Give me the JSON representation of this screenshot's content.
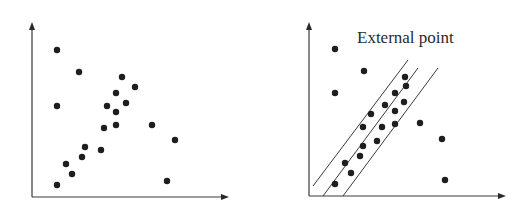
{
  "chart_data": [
    {
      "type": "scatter",
      "title": "",
      "xlabel": "",
      "ylabel": "",
      "grid": false,
      "legend": null,
      "axes": {
        "origin": [
          32,
          197
        ],
        "y_top": 22,
        "x_right": 229
      },
      "points": [
        [
          57,
          50
        ],
        [
          79,
          72
        ],
        [
          57,
          106
        ],
        [
          122,
          77
        ],
        [
          135,
          87
        ],
        [
          116,
          93
        ],
        [
          126,
          103
        ],
        [
          107,
          106
        ],
        [
          116,
          112
        ],
        [
          116,
          125
        ],
        [
          104,
          128
        ],
        [
          152,
          125
        ],
        [
          175,
          140
        ],
        [
          85,
          147
        ],
        [
          101,
          150
        ],
        [
          82,
          157
        ],
        [
          66,
          164
        ],
        [
          72,
          174
        ],
        [
          57,
          185
        ],
        [
          167,
          181
        ]
      ],
      "lines": [],
      "annotations": []
    },
    {
      "type": "scatter",
      "title": "",
      "xlabel": "",
      "ylabel": "",
      "grid": false,
      "legend": null,
      "axes": {
        "origin": [
          309,
          196
        ],
        "y_top": 22,
        "x_right": 506
      },
      "points": [
        [
          335,
          49
        ],
        [
          364,
          71
        ],
        [
          335,
          93
        ],
        [
          405,
          77
        ],
        [
          406,
          86
        ],
        [
          395,
          93
        ],
        [
          404,
          102
        ],
        [
          385,
          105
        ],
        [
          395,
          111
        ],
        [
          371,
          114
        ],
        [
          395,
          124
        ],
        [
          363,
          127
        ],
        [
          382,
          127
        ],
        [
          420,
          123
        ],
        [
          442,
          139
        ],
        [
          363,
          146
        ],
        [
          377,
          141
        ],
        [
          360,
          156
        ],
        [
          345,
          163
        ],
        [
          351,
          173
        ],
        [
          335,
          184
        ],
        [
          445,
          180
        ]
      ],
      "lines": [
        {
          "name": "upper-band-line",
          "x1": 313,
          "y1": 186,
          "x2": 408,
          "y2": 60
        },
        {
          "name": "center-fit-line",
          "x1": 323,
          "y1": 196,
          "x2": 418,
          "y2": 68
        },
        {
          "name": "lower-band-line",
          "x1": 343,
          "y1": 196,
          "x2": 438,
          "y2": 68
        }
      ],
      "annotations": [
        {
          "text": "External point",
          "x": 357,
          "y": 43
        }
      ]
    }
  ],
  "labels": {
    "external_point": "External point"
  }
}
